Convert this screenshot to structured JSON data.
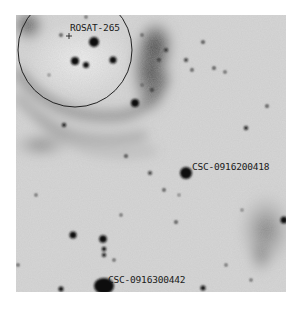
{
  "image": {
    "type": "negative sky survey finder chart",
    "background_color": "#d9d9d9",
    "star_color": "#111111"
  },
  "labels": [
    {
      "text": "ROSAT-265",
      "x": 70,
      "y": 23
    },
    {
      "text": "CSC-0916200418",
      "x": 192,
      "y": 162
    },
    {
      "text": "CSC-0916300442",
      "x": 108,
      "y": 274
    }
  ],
  "markers": {
    "circle": {
      "cx": 75,
      "cy": 50,
      "r": 57,
      "color": "#222222"
    },
    "cross": {
      "x": 66,
      "y": 36,
      "glyph": "+"
    }
  }
}
